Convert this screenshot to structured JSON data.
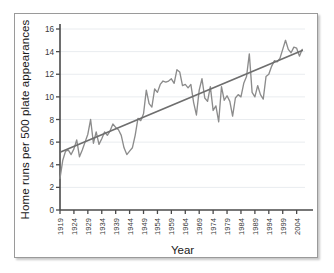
{
  "chart_data": {
    "type": "line",
    "title": "",
    "xlabel": "Year",
    "ylabel": "Home runs per 500 plate appearances",
    "xlim": [
      1919,
      2007
    ],
    "ylim": [
      0,
      16
    ],
    "grid": true,
    "legend_position": "none",
    "ytick_labels": [
      "0",
      "2",
      "4",
      "6",
      "8",
      "10",
      "12",
      "14",
      "16"
    ],
    "ytick_values": [
      0,
      2,
      4,
      6,
      8,
      10,
      12,
      14,
      16
    ],
    "xtick_labels": [
      "1919",
      "1924",
      "1929",
      "1934",
      "1939",
      "1944",
      "1949",
      "1954",
      "1959",
      "1964",
      "1969",
      "1974",
      "1979",
      "1984",
      "1989",
      "1994",
      "1999",
      "2004"
    ],
    "xtick_values": [
      1919,
      1924,
      1929,
      1934,
      1939,
      1944,
      1949,
      1954,
      1959,
      1964,
      1969,
      1974,
      1979,
      1984,
      1989,
      1994,
      1999,
      2004
    ],
    "series": [
      {
        "name": "Home runs per 500 plate appearances",
        "color": "#8c8c8c",
        "style": "line",
        "x": [
          1919,
          1920,
          1921,
          1922,
          1923,
          1924,
          1925,
          1926,
          1927,
          1928,
          1929,
          1930,
          1931,
          1932,
          1933,
          1934,
          1935,
          1936,
          1937,
          1938,
          1939,
          1940,
          1941,
          1942,
          1943,
          1944,
          1945,
          1946,
          1947,
          1948,
          1949,
          1950,
          1951,
          1952,
          1953,
          1954,
          1955,
          1956,
          1957,
          1958,
          1959,
          1960,
          1961,
          1962,
          1963,
          1964,
          1965,
          1966,
          1967,
          1968,
          1969,
          1970,
          1971,
          1972,
          1973,
          1974,
          1975,
          1976,
          1977,
          1978,
          1979,
          1980,
          1981,
          1982,
          1983,
          1984,
          1985,
          1986,
          1987,
          1988,
          1989,
          1990,
          1991,
          1992,
          1993,
          1994,
          1995,
          1996,
          1997,
          1998,
          1999,
          2000,
          2001,
          2002,
          2003,
          2004,
          2005,
          2006
        ],
        "values": [
          2.8,
          4.4,
          5.2,
          5.3,
          4.9,
          5.4,
          6.2,
          4.7,
          5.3,
          6.0,
          6.7,
          8.0,
          5.9,
          6.9,
          5.8,
          6.3,
          6.9,
          6.6,
          7.0,
          7.6,
          7.3,
          7.1,
          6.6,
          5.5,
          4.9,
          5.2,
          5.5,
          6.6,
          8.1,
          7.9,
          8.5,
          10.6,
          9.4,
          9.1,
          10.7,
          10.4,
          11.1,
          11.4,
          11.3,
          11.4,
          11.6,
          11.2,
          12.4,
          12.2,
          11.0,
          11.1,
          10.8,
          11.1,
          9.5,
          8.4,
          10.6,
          11.6,
          9.9,
          9.6,
          10.9,
          8.8,
          9.2,
          7.8,
          10.9,
          9.7,
          10.1,
          9.6,
          8.3,
          9.9,
          10.2,
          10.0,
          11.2,
          11.8,
          13.8,
          10.4,
          10.0,
          11.0,
          10.2,
          9.8,
          11.8,
          12.0,
          12.7,
          13.2,
          13.1,
          13.4,
          14.2,
          15.0,
          14.2,
          13.9,
          14.4,
          14.3,
          13.6,
          14.2
        ]
      },
      {
        "name": "Linear trend",
        "color": "#6e6e6e",
        "style": "trendline",
        "x": [
          1919,
          2006
        ],
        "values": [
          5.1,
          14.1
        ]
      }
    ]
  }
}
